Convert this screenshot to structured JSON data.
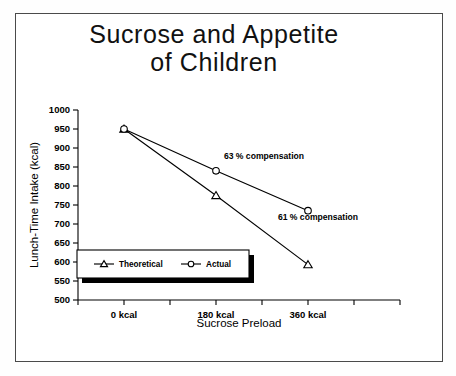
{
  "figure": {
    "title_line1": "Sucrose and Appetite",
    "title_line2": "of Children"
  },
  "chart_data": {
    "type": "line",
    "title": "Sucrose and Appetite of Children",
    "xlabel": "Sucrose Preload",
    "ylabel": "Lunch-Time Intake (kcal)",
    "categories": [
      "0 kcal",
      "180 kcal",
      "360 kcal"
    ],
    "x_values": [
      0,
      180,
      360
    ],
    "ylim": [
      500,
      1000
    ],
    "y_ticks": [
      500,
      550,
      600,
      650,
      700,
      750,
      800,
      850,
      900,
      950,
      1000
    ],
    "y_tick_labels": [
      "500",
      "550",
      "600",
      "650",
      "700",
      "750",
      "800",
      "850",
      "900",
      "950",
      "1000"
    ],
    "x_tick_labels": [
      "0 kcal",
      "180 kcal",
      "360 kcal"
    ],
    "grid": false,
    "legend_position": "lower-left-inside",
    "series": [
      {
        "name": "Theoretical",
        "marker": "triangle",
        "values": [
          950,
          775,
          593
        ]
      },
      {
        "name": "Actual",
        "marker": "circle",
        "values": [
          950,
          840,
          735
        ]
      }
    ],
    "annotations": [
      {
        "text": "63 % compensation",
        "x": 180,
        "y": 872
      },
      {
        "text": "61 % compensation",
        "x": 360,
        "y": 710
      }
    ],
    "colors": {
      "line": "#000000",
      "marker_fill": "#ffffff",
      "background": "#ffffff"
    }
  },
  "axes": {
    "y_label": "Lunch-Time Intake (kcal)",
    "x_label": "Sucrose Preload",
    "y_ticks": [
      "1000",
      "950",
      "900",
      "850",
      "800",
      "750",
      "700",
      "650",
      "600",
      "550",
      "500"
    ],
    "x_ticks": [
      "0 kcal",
      "180 kcal",
      "360 kcal"
    ]
  },
  "legend": {
    "items": [
      {
        "label": "Theoretical",
        "marker": "triangle"
      },
      {
        "label": "Actual",
        "marker": "circle"
      }
    ]
  },
  "annotations": {
    "a1": "63 % compensation",
    "a2": "61 % compensation"
  }
}
